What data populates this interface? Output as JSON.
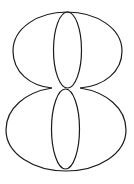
{
  "figure": {
    "stroke_color": "#1a1a1a",
    "background": "#ffffff"
  }
}
